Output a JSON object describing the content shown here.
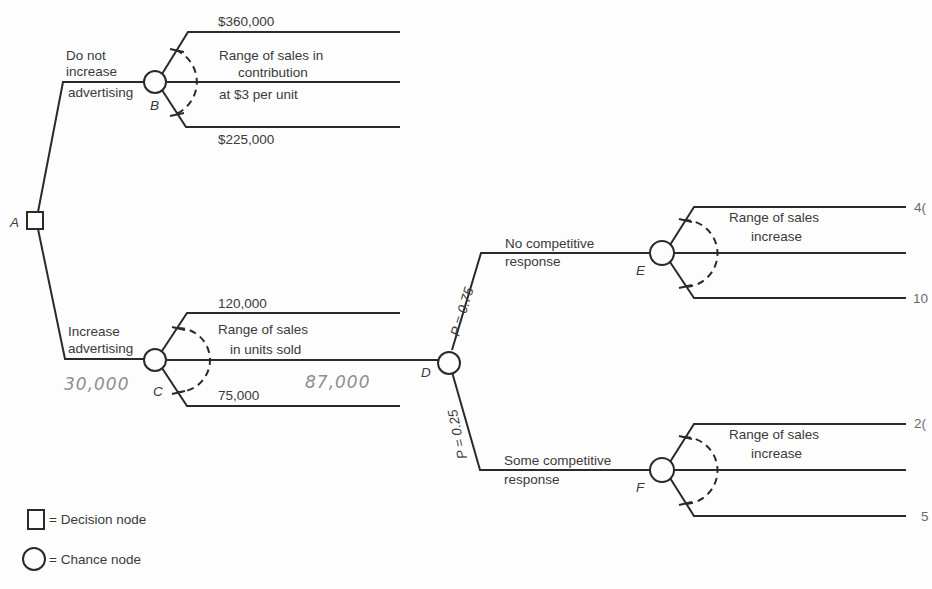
{
  "diagram": {
    "type": "decision-tree",
    "nodes": {
      "A": {
        "label": "A",
        "kind": "decision"
      },
      "B": {
        "label": "B",
        "kind": "chance"
      },
      "C": {
        "label": "C",
        "kind": "chance"
      },
      "D": {
        "label": "D",
        "kind": "chance"
      },
      "E": {
        "label": "E",
        "kind": "chance"
      },
      "F": {
        "label": "F",
        "kind": "chance"
      }
    },
    "branch_A_top": {
      "line1": "Do not",
      "line2": "increase",
      "line3": "advertising"
    },
    "branch_A_bottom": {
      "line1": "Increase",
      "line2": "advertising"
    },
    "node_B": {
      "high": "$360,000",
      "low": "$225,000",
      "range_line1": "Range of sales in",
      "range_line2": "contribution",
      "range_line3": "at $3 per unit"
    },
    "node_C": {
      "high": "120,000",
      "low": "75,000",
      "range_line1": "Range of sales",
      "range_line2": "in units sold",
      "handwritten_left": "30,000",
      "handwritten_mid": "87,000"
    },
    "node_D": {
      "top_prob": "P = 0.75",
      "bottom_prob": "P = 0.25",
      "top_label_line1": "No competitive",
      "top_label_line2": "response",
      "bottom_label_line1": "Some competitive",
      "bottom_label_line2": "response"
    },
    "node_E": {
      "range_line1": "Range of sales",
      "range_line2": "increase",
      "high_cropped": "4(",
      "low_cropped": "10"
    },
    "node_F": {
      "range_line1": "Range of sales",
      "range_line2": "increase",
      "high_cropped": "2(",
      "low_cropped": "5"
    }
  },
  "legend": {
    "decision": "= Decision node",
    "chance": "= Chance node"
  }
}
